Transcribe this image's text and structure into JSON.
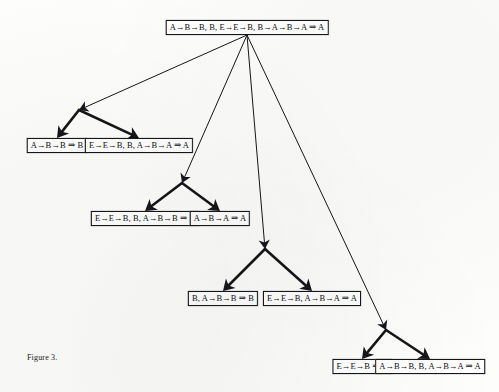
{
  "figure": {
    "caption": "Figure 3.",
    "caption_x": 27,
    "caption_y": 353,
    "background_color": "#fdfdfb",
    "ink_color": "#16161a",
    "node_fill": "#ffffff"
  },
  "diagram": {
    "type": "derivation-tree",
    "nodes": [
      {
        "id": "root",
        "label": "A→B→B, B, E→E→B, B→A→B→A ⇒ A",
        "x": 247,
        "y": 20,
        "level": 0
      },
      {
        "id": "n1",
        "label": "A→B→B ⇒ B",
        "x": 57,
        "y": 138,
        "level": 1
      },
      {
        "id": "n2",
        "label": "E→E→B, B, A→B→A ⇒ A",
        "x": 139,
        "y": 138,
        "level": 1
      },
      {
        "id": "n3",
        "label": "E→E→B, B, A→B→B ⇒ B",
        "x": 145,
        "y": 211,
        "level": 2
      },
      {
        "id": "n4",
        "label": "A→B→A ⇒ A",
        "x": 220,
        "y": 211,
        "level": 2
      },
      {
        "id": "n5",
        "label": "B, A→B→B ⇒ B",
        "x": 223,
        "y": 291,
        "level": 3
      },
      {
        "id": "n6",
        "label": "E→E→B, A→B→A ⇒ A",
        "x": 312,
        "y": 291,
        "level": 3
      },
      {
        "id": "n7",
        "label": "E→E→B ⇒ B",
        "x": 362,
        "y": 359,
        "level": 4
      },
      {
        "id": "n8",
        "label": "A→B→B, B, A→B→A ⇒ A",
        "x": 430,
        "y": 359,
        "level": 4
      }
    ],
    "junctions": [
      {
        "id": "j1",
        "x": 79,
        "y": 110
      },
      {
        "id": "j2",
        "x": 182,
        "y": 183
      },
      {
        "id": "j3",
        "x": 265,
        "y": 249
      },
      {
        "id": "j4",
        "x": 386,
        "y": 330
      }
    ],
    "edges": [
      {
        "from": "root",
        "to": "j1",
        "style": "thin"
      },
      {
        "from": "root",
        "to": "j2",
        "style": "thin"
      },
      {
        "from": "root",
        "to": "j3",
        "style": "thin"
      },
      {
        "from": "root",
        "to": "j4",
        "style": "thin"
      },
      {
        "from": "j1",
        "to": "n1",
        "style": "thick"
      },
      {
        "from": "j1",
        "to": "n2",
        "style": "thick"
      },
      {
        "from": "j2",
        "to": "n3",
        "style": "thick"
      },
      {
        "from": "j2",
        "to": "n4",
        "style": "thick"
      },
      {
        "from": "j3",
        "to": "n5",
        "style": "thick"
      },
      {
        "from": "j3",
        "to": "n6",
        "style": "thick"
      },
      {
        "from": "j4",
        "to": "n7",
        "style": "thick"
      },
      {
        "from": "j4",
        "to": "n8",
        "style": "thick"
      }
    ]
  }
}
